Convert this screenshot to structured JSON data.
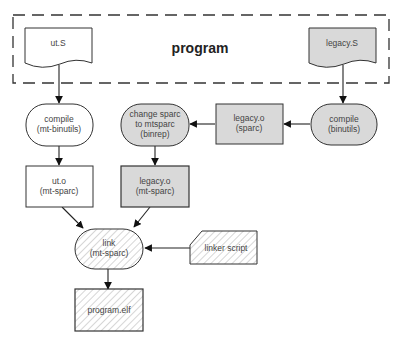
{
  "diagram": {
    "group": {
      "label": "program"
    },
    "colors": {
      "gray_fill": "#d9d9d9",
      "white_fill": "#ffffff",
      "stroke": "#333333",
      "hatch": "#bbbbbb"
    },
    "nodes": {
      "ut_s": {
        "line1": "ut.S"
      },
      "legacy_s": {
        "line1": "legacy.S"
      },
      "compile_mt": {
        "line1": "compile",
        "line2": "(mt-binutils)"
      },
      "change_sparc": {
        "line1": "change sparc",
        "line2": "to mtsparc",
        "line3": "(binrep)"
      },
      "legacy_o_sparc": {
        "line1": "legacy.o",
        "line2": "(sparc)"
      },
      "compile_binutils": {
        "line1": "compile",
        "line2": "(binutils)"
      },
      "ut_o": {
        "line1": "ut.o",
        "line2": "(mt-sparc)"
      },
      "legacy_o_mt": {
        "line1": "legacy.o",
        "line2": "(mt-sparc)"
      },
      "link": {
        "line1": "link",
        "line2": "(mt-sparc)"
      },
      "linker_script": {
        "line1": "linker script"
      },
      "program_elf": {
        "line1": "program.elf"
      }
    },
    "edges": [
      {
        "from": "ut.S",
        "to": "compile (mt-binutils)"
      },
      {
        "from": "legacy.S",
        "to": "compile (binutils)"
      },
      {
        "from": "compile (binutils)",
        "to": "legacy.o (sparc)"
      },
      {
        "from": "legacy.o (sparc)",
        "to": "change sparc to mtsparc (binrep)"
      },
      {
        "from": "compile (mt-binutils)",
        "to": "ut.o (mt-sparc)"
      },
      {
        "from": "change sparc to mtsparc (binrep)",
        "to": "legacy.o (mt-sparc)"
      },
      {
        "from": "ut.o (mt-sparc)",
        "to": "link (mt-sparc)"
      },
      {
        "from": "legacy.o (mt-sparc)",
        "to": "link (mt-sparc)"
      },
      {
        "from": "linker script",
        "to": "link (mt-sparc)"
      },
      {
        "from": "link (mt-sparc)",
        "to": "program.elf"
      }
    ]
  }
}
